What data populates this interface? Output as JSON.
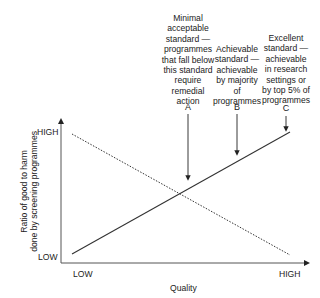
{
  "diagram": {
    "y_axis": {
      "label_line1": "Ratio of good to harm",
      "label_line2": "done by screening programmes",
      "high": "HIGH",
      "low": "LOW"
    },
    "x_axis": {
      "label": "Quality",
      "low": "LOW",
      "high": "HIGH"
    },
    "series": [
      {
        "name": "benefit-line",
        "style": "solid",
        "direction": "increasing"
      },
      {
        "name": "harm-line",
        "style": "dotted",
        "direction": "decreasing"
      }
    ],
    "markers": [
      {
        "letter": "A",
        "lines": [
          "Minimal",
          "acceptable",
          "standard —",
          "programmes",
          "that fall below",
          "this standard",
          "require",
          "remedial",
          "action"
        ]
      },
      {
        "letter": "B",
        "lines": [
          "Achievable",
          "standard —",
          "achievable",
          "by majority",
          "of",
          "programmes"
        ]
      },
      {
        "letter": "C",
        "lines": [
          "Excellent",
          "standard —",
          "achievable",
          "in research",
          "settings or",
          "by top 5% of",
          "programmes"
        ]
      }
    ],
    "colors": {
      "line": "#333333",
      "axis": "#555555",
      "text": "#222222"
    }
  }
}
